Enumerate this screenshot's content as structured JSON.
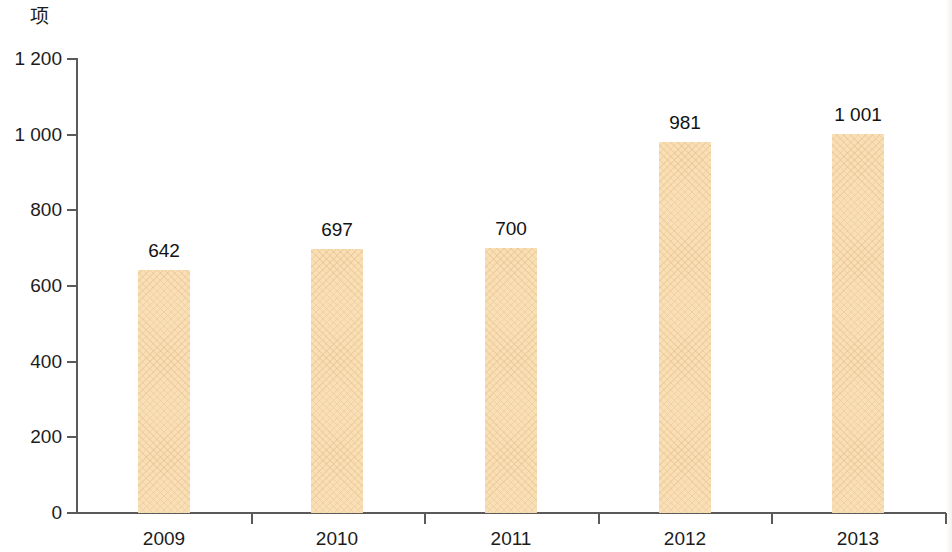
{
  "chart_data": {
    "type": "bar",
    "title": "",
    "subtitle": "",
    "xlabel": "",
    "ylabel": "项",
    "ylim": [
      0,
      1200
    ],
    "ytick_step": 200,
    "grid": false,
    "legend": null,
    "categories": [
      "2009",
      "2010",
      "2011",
      "2012",
      "2013"
    ],
    "values": [
      642,
      697,
      700,
      981,
      1001
    ],
    "value_labels": [
      "642",
      "697",
      "700",
      "981",
      "1 001"
    ],
    "ytick_labels": [
      "1 200",
      "1 000",
      "800",
      "600",
      "400",
      "200",
      "0"
    ],
    "ytick_values": [
      1200,
      1000,
      800,
      600,
      400,
      200,
      0
    ],
    "bar_color": "#f8dfb6",
    "axis_color": "#5a5a5a",
    "text_color": "#1c1c1c"
  },
  "axis": {
    "unit_label": "项"
  }
}
